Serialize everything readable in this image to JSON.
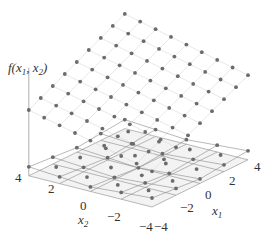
{
  "chart_data": {
    "type": "scatter3d",
    "title": "",
    "zlabel": "f(x1, x2)",
    "xlabel": "x1",
    "ylabel": "x2",
    "x1_ticks": [
      "-4",
      "-2",
      "0",
      "2",
      "4"
    ],
    "x2_ticks": [
      "-4",
      "-2",
      "0",
      "2",
      "4"
    ],
    "x1_range": [
      -4,
      4
    ],
    "x2_range": [
      -4,
      4
    ],
    "grid_step": 1,
    "floor_grid_step": 2,
    "surfaces": [
      {
        "name": "upper plane",
        "description": "linear function evaluated on 9x9 grid (x1,x2 in -4..4, step 1)",
        "form": "f = a + b*x1 + c*x2",
        "a": 8.0,
        "b": 0.65,
        "c": 0.4
      },
      {
        "name": "lower surface",
        "description": "low-valued function near floor evaluated on 5x5 grid (x1,x2 in -4..4, step 2)",
        "form": "f = d*(|x1|+|x2|)",
        "d": 0.12
      }
    ],
    "colors": {
      "dots": "#6b6b6b",
      "grid": "#d9d9d9",
      "floor_lines": "#9a9a9a",
      "floor_fill": "#f3f3f3"
    }
  },
  "labels": {
    "z_axis": "f(x",
    "z_sub1": "1",
    "z_mid": ", x",
    "z_sub2": "2",
    "z_end": ")",
    "x1_axis": "x",
    "x1_sub": "1",
    "x2_axis": "x",
    "x2_sub": "2",
    "x1_tick_m4": "−4",
    "x1_tick_m2": "−2",
    "x1_tick_0": "0",
    "x1_tick_2": "2",
    "x1_tick_4": "4",
    "x2_tick_m4": "−4",
    "x2_tick_m2": "−2",
    "x2_tick_0": "0",
    "x2_tick_2": "2",
    "x2_tick_4": "4"
  }
}
